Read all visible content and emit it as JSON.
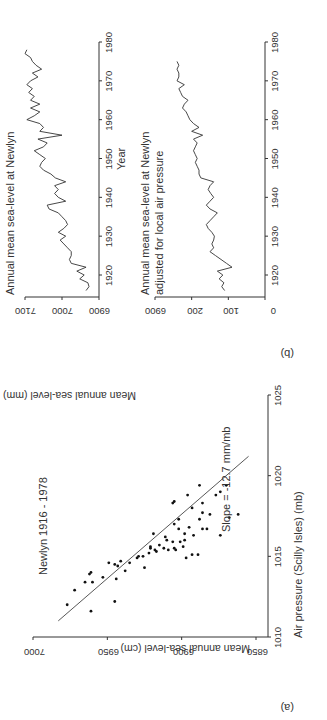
{
  "panel_a": {
    "tag": "(a)",
    "title": "Newlyn 1916 - 1978",
    "ylabel": "Mean annual sea-level (cm)",
    "xlabel": "Air pressure (Scilly Isles) (mb)",
    "annotation": "Slope = -12.7 mm/mb"
  },
  "panel_b": {
    "tag": "(b)",
    "ylabel": "Mean annual sea-level (mm)",
    "top_title": "Annual mean sea-level at Newlyn",
    "bottom_title_1": "Annual mean sea-level at Newlyn",
    "bottom_title_2": "adjusted for local air pressure",
    "top_xlabel": "Year",
    "bottom_xlabel": "Year"
  },
  "chart_data": [
    {
      "type": "scatter",
      "title": "Newlyn 1916 - 1978",
      "xlabel": "Air pressure (Scilly Isles) (mb)",
      "ylabel": "Mean annual sea-level (cm)",
      "xlim": [
        1010,
        1025
      ],
      "ylim": [
        6850,
        7000
      ],
      "xticks": [
        1010,
        1015,
        1020,
        1025
      ],
      "yticks": [
        6850,
        6900,
        6950,
        7000
      ],
      "annotation": "Slope = -12.7 mm/mb",
      "fit_line": {
        "x": [
          1011.0,
          1021.2
        ],
        "y": [
          6983,
          6855
        ]
      },
      "points": [
        [
          1011.6,
          6961
        ],
        [
          1012.2,
          6945
        ],
        [
          1012.0,
          6977
        ],
        [
          1012.9,
          6972
        ],
        [
          1013.4,
          6960
        ],
        [
          1013.4,
          6965
        ],
        [
          1013.7,
          6953
        ],
        [
          1013.9,
          6962
        ],
        [
          1014.0,
          6961
        ],
        [
          1013.6,
          6944
        ],
        [
          1014.5,
          6945
        ],
        [
          1014.6,
          6949
        ],
        [
          1014.4,
          6943
        ],
        [
          1014.6,
          6935
        ],
        [
          1014.1,
          6938
        ],
        [
          1014.3,
          6925
        ],
        [
          1014.7,
          6941
        ],
        [
          1014.9,
          6930
        ],
        [
          1015.0,
          6926
        ],
        [
          1015.0,
          6929
        ],
        [
          1015.2,
          6922
        ],
        [
          1015.3,
          6917
        ],
        [
          1015.4,
          6918
        ],
        [
          1015.4,
          6909
        ],
        [
          1015.5,
          6912
        ],
        [
          1015.5,
          6921
        ],
        [
          1015.6,
          6921
        ],
        [
          1015.7,
          6915
        ],
        [
          1015.9,
          6906
        ],
        [
          1016.0,
          6898
        ],
        [
          1015.6,
          6899
        ],
        [
          1015.9,
          6901
        ],
        [
          1016.3,
          6892
        ],
        [
          1016.4,
          6898
        ],
        [
          1016.4,
          6919
        ],
        [
          1016.2,
          6911
        ],
        [
          1016.7,
          6902
        ],
        [
          1016.7,
          6886
        ],
        [
          1016.7,
          6883
        ],
        [
          1016.8,
          6895
        ],
        [
          1017.0,
          6905
        ],
        [
          1017.3,
          6888
        ],
        [
          1017.3,
          6902
        ],
        [
          1017.6,
          6881
        ],
        [
          1017.7,
          6886
        ],
        [
          1018.0,
          6893
        ],
        [
          1018.3,
          6886
        ],
        [
          1018.4,
          6905
        ],
        [
          1018.8,
          6877
        ],
        [
          1018.8,
          6896
        ],
        [
          1019.0,
          6874
        ],
        [
          1019.4,
          6870
        ],
        [
          1019.4,
          6888
        ],
        [
          1017.4,
          6868
        ],
        [
          1017.6,
          6862
        ],
        [
          1018.3,
          6906
        ],
        [
          1015.1,
          6893
        ],
        [
          1015.1,
          6889
        ],
        [
          1015.4,
          6904
        ],
        [
          1016.3,
          6874
        ],
        [
          1014.9,
          6897
        ],
        [
          1015.5,
          6905
        ],
        [
          1016.0,
          6910
        ]
      ]
    },
    {
      "type": "line",
      "title": "Annual mean sea-level at Newlyn",
      "xlabel": "Year",
      "ylabel": "Mean annual sea-level (mm)",
      "xlim": [
        1915,
        1980
      ],
      "ylim": [
        6900,
        7100
      ],
      "xticks": [
        1920,
        1930,
        1940,
        1950,
        1960,
        1970,
        1980
      ],
      "yticks": [
        6900,
        7000,
        7100
      ],
      "x": [
        1916,
        1917,
        1918,
        1919,
        1920,
        1921,
        1922,
        1923,
        1924,
        1925,
        1926,
        1927,
        1928,
        1929,
        1930,
        1931,
        1932,
        1933,
        1934,
        1935,
        1936,
        1937,
        1938,
        1939,
        1940,
        1941,
        1942,
        1943,
        1944,
        1945,
        1946,
        1947,
        1948,
        1949,
        1950,
        1951,
        1952,
        1953,
        1954,
        1955,
        1956,
        1957,
        1958,
        1959,
        1960,
        1961,
        1962,
        1963,
        1964,
        1965,
        1966,
        1967,
        1968,
        1969,
        1970,
        1971,
        1972,
        1973,
        1974,
        1975,
        1976,
        1977,
        1978
      ],
      "y": [
        6935,
        6927,
        6930,
        6952,
        6940,
        6960,
        6935,
        6975,
        6980,
        6975,
        6975,
        6985,
        6995,
        7005,
        6990,
        7010,
        6995,
        6985,
        6990,
        7000,
        7010,
        7035,
        7040,
        6990,
        7010,
        7020,
        7010,
        7020,
        6990,
        7018,
        7030,
        7050,
        7060,
        7055,
        7045,
        7060,
        7075,
        7050,
        7040,
        7065,
        7000,
        7060,
        7050,
        7060,
        7095,
        7075,
        7060,
        7085,
        7060,
        7085,
        7075,
        7090,
        7080,
        7095,
        7085,
        7065,
        7080,
        7055,
        7070,
        7080,
        7085,
        7100,
        7095
      ]
    },
    {
      "type": "line",
      "title": "Annual mean sea-level at Newlyn adjusted for local air pressure",
      "xlabel": "Year",
      "ylabel": "Mean annual sea-level (mm)",
      "xlim": [
        1915,
        1980
      ],
      "ylim": [
        0,
        300
      ],
      "xticks": [
        1920,
        1930,
        1940,
        1950,
        1960,
        1970,
        1980
      ],
      "ytick_labels": [
        "0",
        "100",
        "200",
        "6900"
      ],
      "yticks": [
        0,
        100,
        200,
        300
      ],
      "x": [
        1916,
        1917,
        1918,
        1919,
        1920,
        1921,
        1922,
        1923,
        1924,
        1925,
        1926,
        1927,
        1928,
        1929,
        1930,
        1931,
        1932,
        1933,
        1934,
        1935,
        1936,
        1937,
        1938,
        1939,
        1940,
        1941,
        1942,
        1943,
        1944,
        1945,
        1946,
        1947,
        1948,
        1949,
        1950,
        1951,
        1952,
        1953,
        1954,
        1955,
        1956,
        1957,
        1958,
        1959,
        1960,
        1961,
        1962,
        1963,
        1964,
        1965,
        1966,
        1967,
        1968,
        1969,
        1970,
        1971,
        1972,
        1973,
        1974,
        1975
      ],
      "y": [
        110,
        118,
        112,
        125,
        115,
        130,
        90,
        105,
        120,
        135,
        150,
        140,
        145,
        140,
        138,
        145,
        155,
        160,
        150,
        140,
        130,
        150,
        160,
        150,
        140,
        148,
        155,
        150,
        140,
        175,
        180,
        180,
        185,
        190,
        185,
        190,
        195,
        190,
        185,
        195,
        170,
        200,
        180,
        195,
        205,
        210,
        215,
        225,
        220,
        210,
        225,
        230,
        235,
        220,
        240,
        235,
        235,
        240,
        235,
        240
      ]
    }
  ]
}
